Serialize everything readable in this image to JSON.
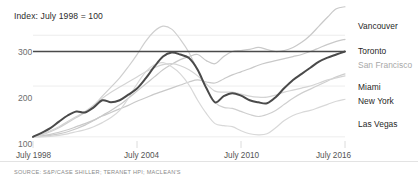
{
  "chart_data": {
    "type": "line",
    "title": "Index: July 1998 = 100",
    "subtitle": "",
    "xlabel": "",
    "ylabel": "",
    "source": "SOURCE: S&P/CASE SHILLER; TERANET HPI; MACLEAN'S",
    "grid": true,
    "legend_position": "right",
    "ylim": [
      80,
      330
    ],
    "yticks": [
      100,
      200,
      300
    ],
    "ytick_labels": [
      "100",
      "200",
      "300"
    ],
    "xlim": [
      1998.5,
      2016.5
    ],
    "xticks": [
      1998.5,
      2004.5,
      2010.5,
      2016.5
    ],
    "xtick_labels": [
      "July 1998",
      "July 2004",
      "July 2010",
      "July 2016"
    ],
    "reference_line": {
      "label": "Toronto",
      "value": 268,
      "color": "#4a4a4a",
      "note": "flat dark rule drawn across plot at Toronto end level"
    },
    "x": [
      1998.5,
      1999.0,
      1999.5,
      2000.0,
      2000.5,
      2001.0,
      2001.5,
      2002.0,
      2002.5,
      2003.0,
      2003.5,
      2004.0,
      2004.5,
      2005.0,
      2005.5,
      2006.0,
      2006.5,
      2007.0,
      2007.5,
      2008.0,
      2008.5,
      2009.0,
      2009.5,
      2010.0,
      2010.5,
      2011.0,
      2011.5,
      2012.0,
      2012.5,
      2013.0,
      2013.5,
      2014.0,
      2014.5,
      2015.0,
      2015.5,
      2016.0,
      2016.5
    ],
    "series": [
      {
        "name": "San Francisco",
        "color": "#4a4a4a",
        "width": 2.0,
        "emphasis": "high",
        "values": [
          100,
          108,
          117,
          130,
          142,
          150,
          148,
          158,
          172,
          168,
          172,
          183,
          195,
          215,
          238,
          258,
          266,
          262,
          255,
          232,
          196,
          168,
          180,
          186,
          181,
          172,
          168,
          166,
          178,
          196,
          212,
          224,
          236,
          248,
          256,
          262,
          268
        ]
      },
      {
        "name": "Vancouver",
        "color": "#c9c9c9",
        "width": 1.2,
        "emphasis": "low",
        "values": [
          100,
          101,
          103,
          106,
          110,
          116,
          123,
          132,
          142,
          152,
          163,
          176,
          190,
          204,
          218,
          232,
          243,
          252,
          258,
          262,
          250,
          244,
          258,
          268,
          270,
          272,
          276,
          272,
          268,
          270,
          276,
          286,
          300,
          318,
          336,
          352,
          356
        ]
      },
      {
        "name": "Toronto",
        "color": "#c9c9c9",
        "width": 1.2,
        "emphasis": "low",
        "values": [
          100,
          102,
          105,
          109,
          114,
          120,
          126,
          133,
          141,
          148,
          155,
          162,
          170,
          177,
          184,
          190,
          196,
          202,
          208,
          212,
          208,
          206,
          214,
          222,
          228,
          234,
          241,
          246,
          250,
          254,
          258,
          262,
          268,
          275,
          282,
          288,
          292
        ]
      },
      {
        "name": "Miami",
        "color": "#cfcfcf",
        "width": 1.2,
        "emphasis": "low",
        "values": [
          100,
          104,
          110,
          118,
          128,
          138,
          148,
          162,
          180,
          198,
          216,
          238,
          262,
          288,
          308,
          318,
          312,
          292,
          266,
          230,
          196,
          168,
          158,
          156,
          150,
          144,
          140,
          144,
          152,
          164,
          176,
          186,
          194,
          202,
          210,
          218,
          224
        ]
      },
      {
        "name": "New York",
        "color": "#d4d4d4",
        "width": 1.2,
        "emphasis": "low",
        "values": [
          100,
          105,
          112,
          120,
          130,
          140,
          150,
          162,
          176,
          188,
          198,
          208,
          218,
          228,
          236,
          242,
          244,
          240,
          232,
          220,
          204,
          190,
          188,
          188,
          184,
          180,
          178,
          178,
          182,
          188,
          192,
          196,
          200,
          206,
          212,
          216,
          220
        ]
      },
      {
        "name": "Las Vegas",
        "color": "#d8d8d8",
        "width": 1.2,
        "emphasis": "low",
        "values": [
          100,
          100,
          101,
          103,
          106,
          110,
          114,
          120,
          128,
          138,
          152,
          176,
          204,
          228,
          242,
          246,
          238,
          224,
          202,
          172,
          146,
          126,
          122,
          120,
          112,
          106,
          104,
          106,
          118,
          132,
          142,
          148,
          152,
          158,
          164,
          170,
          174
        ]
      }
    ],
    "legend_entries": [
      {
        "label": "Vancouver",
        "color": "#1f1f1f",
        "style": "dark"
      },
      {
        "label": "Toronto",
        "color": "#1f1f1f",
        "style": "dark"
      },
      {
        "label": "San Francisco",
        "color": "#a8a8a8",
        "style": "light"
      },
      {
        "label": "Miami",
        "color": "#1f1f1f",
        "style": "dark"
      },
      {
        "label": "New York",
        "color": "#1f1f1f",
        "style": "dark"
      },
      {
        "label": "Las Vegas",
        "color": "#1f1f1f",
        "style": "dark"
      }
    ]
  }
}
